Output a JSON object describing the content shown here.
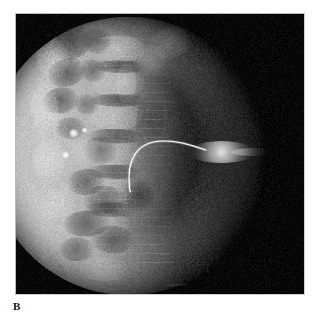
{
  "figure": {
    "panel_label": "B",
    "modality": "fluoroscopy",
    "view": "lateral lumbar spine",
    "background_color": "#ffffff",
    "frame_color": "#050505",
    "frame_border_color": "#b9b9b9",
    "frame": {
      "x": 15,
      "y": 13,
      "width": 290,
      "height": 282
    },
    "label_position": {
      "x": 13,
      "y": 300
    }
  },
  "image_content": {
    "field_of_view": {
      "shape": "circle",
      "description": "collimated circular fluoroscopic field",
      "center_x": 128,
      "center_y": 156,
      "radius": 140,
      "brightness": "high on left, fading to black on right"
    },
    "anatomy": [
      {
        "name": "lumbar-vertebral-bodies",
        "description": "stacked vertebral bodies, lateral projection",
        "count": 5
      },
      {
        "name": "intervertebral-disc-spaces",
        "description": "dark horizontal bands between vertebral bodies",
        "count": 4
      },
      {
        "name": "spinous-processes",
        "description": "posterior elements projecting right of bodies"
      },
      {
        "name": "bowel-gas-shadows",
        "description": "irregular dark patches overlying upper vertebrae"
      },
      {
        "name": "soft-tissue",
        "description": "dark unexposed soft tissue to the right of the spine"
      }
    ],
    "devices": [
      {
        "name": "catheter",
        "description": "radiopaque curved catheter arcing from soft tissue into the vertebral body",
        "appearance": "thin bright white curvilinear line",
        "entry_x": 130,
        "entry_y": 192,
        "apex_x": 160,
        "apex_y": 141
      },
      {
        "name": "contrast-collection",
        "description": "elongated fusiform bright contrast/soft-tissue opacity extending right from catheter",
        "center_x": 222,
        "center_y": 152,
        "length": 70,
        "height": 22
      }
    ],
    "bright_foci": [
      {
        "name": "calcific-focus-upper",
        "x": 73,
        "y": 133,
        "size": 5
      },
      {
        "name": "calcific-focus-lower",
        "x": 65,
        "y": 155,
        "size": 4
      },
      {
        "name": "calcific-focus-small",
        "x": 84,
        "y": 130,
        "size": 3
      }
    ],
    "colors": {
      "black": "#050505",
      "dark_gray": "#2a2a2a",
      "mid_gray": "#8c8c8c",
      "light_gray": "#c8c8c8",
      "bright_white": "#f2f2f2"
    }
  }
}
